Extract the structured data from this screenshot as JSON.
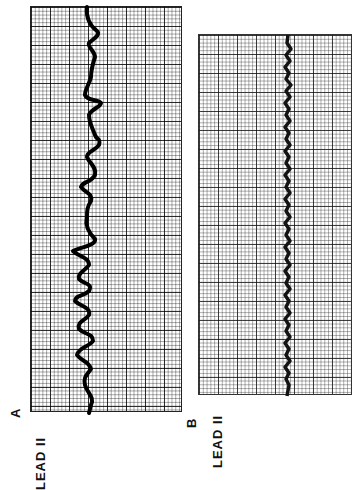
{
  "figure": {
    "panels": [
      {
        "id": "A",
        "label": "A",
        "lead": "LEAD  II",
        "description": "ECG strip with irregular larger-amplitude oscillating waveform"
      },
      {
        "id": "B",
        "label": "B",
        "lead": "LEAD  II",
        "description": "ECG strip with regular low-amplitude fine sawtooth waveform"
      }
    ]
  },
  "colors": {
    "grid": "#000000",
    "trace": "#000000",
    "background": "#ffffff"
  }
}
